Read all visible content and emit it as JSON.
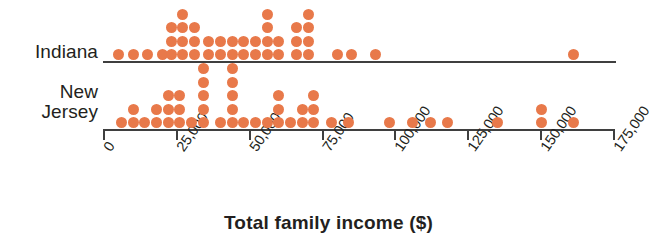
{
  "chart_data": {
    "type": "dotplot",
    "title": "",
    "xlabel": "Total family income ($)",
    "ylabel": "",
    "xlim": [
      0,
      175000
    ],
    "xticks": [
      0,
      25000,
      50000,
      75000,
      100000,
      125000,
      150000,
      175000
    ],
    "xticklabels": [
      "0",
      "25,000",
      "50,000",
      "75,000",
      "100,000",
      "125,000",
      "150,000",
      "175,000"
    ],
    "grid": false,
    "legend": "none",
    "dot_color": "#E8794A",
    "axis_color": "#3f3f3f",
    "categories": [
      "Indiana",
      "New Jersey"
    ],
    "series": [
      {
        "name": "Indiana",
        "label_lines": [
          "Indiana"
        ],
        "bin_width": 5000,
        "bins": [
          {
            "value": 5000,
            "count": 1
          },
          {
            "value": 10000,
            "count": 1
          },
          {
            "value": 15000,
            "count": 1
          },
          {
            "value": 20000,
            "count": 1
          },
          {
            "value": 23000,
            "count": 3
          },
          {
            "value": 27000,
            "count": 4
          },
          {
            "value": 31000,
            "count": 3
          },
          {
            "value": 36000,
            "count": 2
          },
          {
            "value": 40000,
            "count": 2
          },
          {
            "value": 44000,
            "count": 2
          },
          {
            "value": 48000,
            "count": 2
          },
          {
            "value": 52000,
            "count": 2
          },
          {
            "value": 56000,
            "count": 4
          },
          {
            "value": 60000,
            "count": 2
          },
          {
            "value": 66000,
            "count": 3
          },
          {
            "value": 70000,
            "count": 4
          },
          {
            "value": 80000,
            "count": 1
          },
          {
            "value": 85000,
            "count": 1
          },
          {
            "value": 93000,
            "count": 1
          },
          {
            "value": 161000,
            "count": 1
          }
        ],
        "total_count": 41
      },
      {
        "name": "New Jersey",
        "label_lines": [
          "New",
          "Jersey"
        ],
        "bin_width": 5000,
        "bins": [
          {
            "value": 6000,
            "count": 1
          },
          {
            "value": 10000,
            "count": 2
          },
          {
            "value": 14000,
            "count": 1
          },
          {
            "value": 18000,
            "count": 2
          },
          {
            "value": 22000,
            "count": 3
          },
          {
            "value": 26000,
            "count": 3
          },
          {
            "value": 30000,
            "count": 1
          },
          {
            "value": 34000,
            "count": 5
          },
          {
            "value": 40000,
            "count": 1
          },
          {
            "value": 44000,
            "count": 5
          },
          {
            "value": 48000,
            "count": 1
          },
          {
            "value": 52000,
            "count": 1
          },
          {
            "value": 56000,
            "count": 1
          },
          {
            "value": 60000,
            "count": 3
          },
          {
            "value": 64000,
            "count": 1
          },
          {
            "value": 68000,
            "count": 2
          },
          {
            "value": 72000,
            "count": 3
          },
          {
            "value": 78000,
            "count": 1
          },
          {
            "value": 84000,
            "count": 1
          },
          {
            "value": 98000,
            "count": 1
          },
          {
            "value": 106000,
            "count": 1
          },
          {
            "value": 112000,
            "count": 1
          },
          {
            "value": 118000,
            "count": 1
          },
          {
            "value": 135000,
            "count": 1
          },
          {
            "value": 150000,
            "count": 2
          },
          {
            "value": 161000,
            "count": 1
          }
        ],
        "total_count": 46
      }
    ]
  }
}
